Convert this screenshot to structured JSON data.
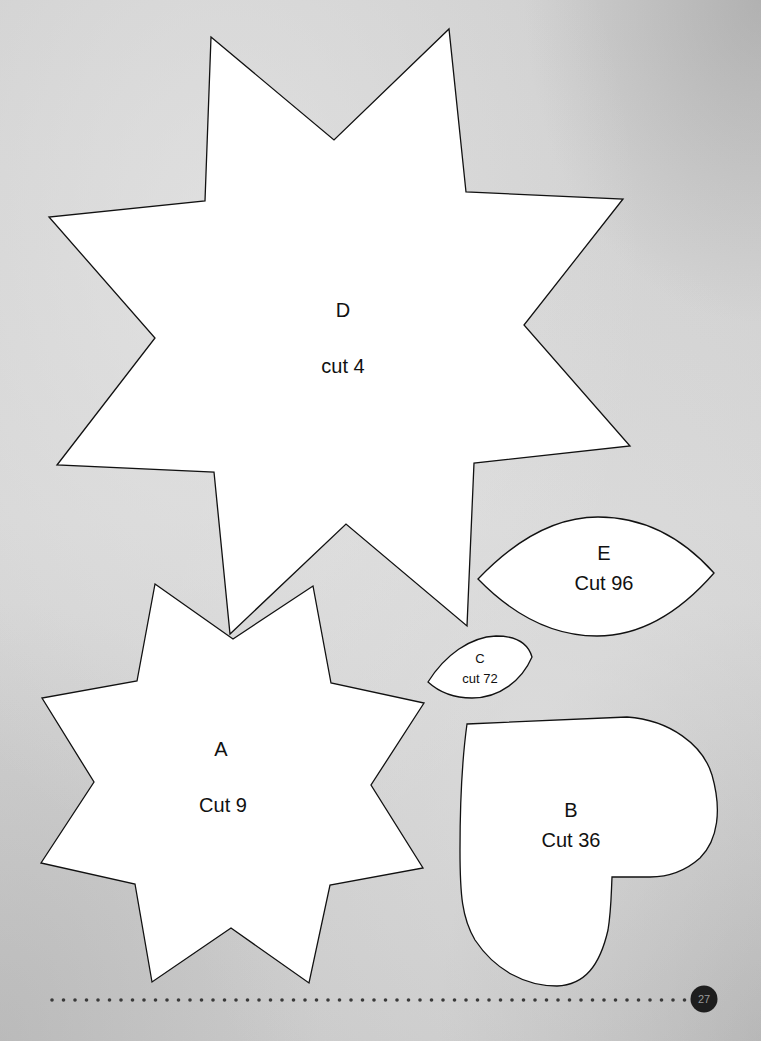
{
  "page": {
    "background_color": "#d2d2d2",
    "outline_color": "#111111",
    "fill_color": "#ffffff",
    "page_number": "27"
  },
  "templates": [
    {
      "id": "D",
      "letter": "D",
      "instruction": "cut 4",
      "shape": "8-point-star"
    },
    {
      "id": "A",
      "letter": "A",
      "instruction": "Cut 9",
      "shape": "8-point-star"
    },
    {
      "id": "E",
      "letter": "E",
      "instruction": "Cut 96",
      "shape": "leaf"
    },
    {
      "id": "C",
      "letter": "C",
      "instruction": "cut 72",
      "shape": "leaf"
    },
    {
      "id": "B",
      "letter": "B",
      "instruction": "Cut 36",
      "shape": "heart"
    }
  ],
  "footer": {
    "dotted_rule": "dotted-line",
    "page_badge": "27"
  }
}
